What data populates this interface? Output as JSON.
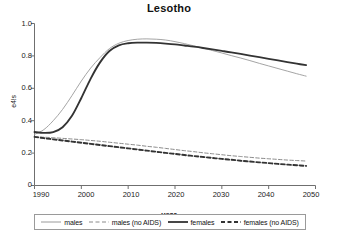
{
  "chart_data": {
    "type": "line",
    "title": "Lesotho",
    "xlabel": "year",
    "ylabel": "e4!s",
    "xlim": [
      1990,
      2050
    ],
    "ylim": [
      0,
      1.0
    ],
    "grid": false,
    "legend_position": "bottom",
    "xticks": [
      "1990",
      "2000",
      "2010",
      "2020",
      "2030",
      "2040",
      "2050"
    ],
    "yticks": [
      "0",
      "0.2",
      "0.4",
      "0.6",
      "0.8",
      "1.0"
    ],
    "x": [
      1990,
      1992,
      1994,
      1996,
      1998,
      2000,
      2002,
      2004,
      2006,
      2008,
      2010,
      2012,
      2014,
      2016,
      2018,
      2020,
      2022,
      2024,
      2026,
      2028,
      2030,
      2032,
      2034,
      2036,
      2038,
      2040,
      2042,
      2044,
      2046,
      2048
    ],
    "series": [
      {
        "name": "males",
        "style": "solid-thin",
        "color": "#9a9a9a",
        "values": [
          0.315,
          0.345,
          0.4,
          0.47,
          0.555,
          0.645,
          0.725,
          0.79,
          0.845,
          0.878,
          0.895,
          0.903,
          0.905,
          0.903,
          0.898,
          0.888,
          0.876,
          0.862,
          0.848,
          0.833,
          0.818,
          0.802,
          0.787,
          0.771,
          0.754,
          0.738,
          0.722,
          0.706,
          0.69,
          0.675
        ]
      },
      {
        "name": "males (no AIDS)",
        "style": "dashed-thin",
        "color": "#7d7d7d",
        "values": [
          0.3,
          0.298,
          0.295,
          0.291,
          0.287,
          0.283,
          0.278,
          0.273,
          0.267,
          0.261,
          0.255,
          0.249,
          0.242,
          0.236,
          0.229,
          0.222,
          0.215,
          0.209,
          0.202,
          0.196,
          0.19,
          0.184,
          0.179,
          0.174,
          0.169,
          0.165,
          0.161,
          0.157,
          0.154,
          0.151
        ]
      },
      {
        "name": "females",
        "style": "solid-thick",
        "color": "#333333",
        "values": [
          0.33,
          0.325,
          0.33,
          0.36,
          0.43,
          0.54,
          0.66,
          0.76,
          0.83,
          0.865,
          0.878,
          0.882,
          0.882,
          0.88,
          0.876,
          0.871,
          0.864,
          0.857,
          0.849,
          0.84,
          0.831,
          0.822,
          0.812,
          0.802,
          0.792,
          0.782,
          0.772,
          0.762,
          0.752,
          0.743
        ]
      },
      {
        "name": "females (no AIDS)",
        "style": "dashed-thick",
        "color": "#333333",
        "values": [
          0.3,
          0.292,
          0.285,
          0.278,
          0.271,
          0.264,
          0.257,
          0.25,
          0.243,
          0.236,
          0.229,
          0.222,
          0.215,
          0.208,
          0.201,
          0.195,
          0.188,
          0.182,
          0.176,
          0.17,
          0.164,
          0.159,
          0.153,
          0.148,
          0.143,
          0.138,
          0.133,
          0.129,
          0.125,
          0.121
        ]
      }
    ]
  },
  "legend": {
    "items": [
      {
        "label": "males"
      },
      {
        "label": "males (no AIDS)"
      },
      {
        "label": "females"
      },
      {
        "label": "females (no AIDS)"
      }
    ]
  }
}
